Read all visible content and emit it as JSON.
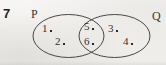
{
  "figure": {
    "question_number": "7",
    "type": "venn-diagram",
    "background_color": "#f4f3f1",
    "stroke_color": "#4a4745"
  },
  "sets": {
    "left": {
      "label": "P"
    },
    "right": {
      "label": "Q"
    }
  },
  "regions": {
    "left_only": {
      "name": "P only",
      "elements": [
        {
          "value": "1",
          "separator": "."
        },
        {
          "value": "2",
          "separator": "."
        }
      ]
    },
    "intersection": {
      "name": "P and Q",
      "elements": [
        {
          "value": "5",
          "separator": "."
        },
        {
          "value": "6",
          "separator": "."
        }
      ]
    },
    "right_only": {
      "name": "Q only",
      "elements": [
        {
          "value": "3",
          "separator": "."
        },
        {
          "value": "4",
          "separator": "."
        }
      ]
    }
  }
}
